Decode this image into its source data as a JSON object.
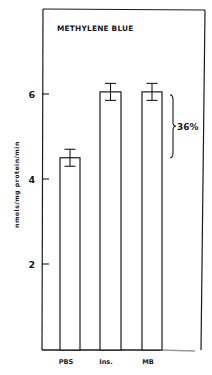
{
  "chart_data": {
    "type": "bar",
    "title": "METHYLENE BLUE",
    "xlabel": "",
    "ylabel": "nmols/mg protein/min",
    "categories": [
      "PBS",
      "Ins.",
      "MB"
    ],
    "values": [
      4.5,
      6.05,
      6.05
    ],
    "error": [
      0.2,
      0.2,
      0.2
    ],
    "ylim": [
      0,
      7.8
    ],
    "yticks": [
      2,
      4,
      6
    ],
    "ytick_labels": [
      "2",
      "4",
      "6"
    ],
    "grid": false,
    "legend": null,
    "annotations": [
      {
        "type": "brace",
        "from_value": 4.5,
        "to_value": 6.05,
        "label": "36%"
      }
    ]
  },
  "colors": {
    "ink": "#1a1a1a",
    "bar_fill": "#ffffff",
    "background": "#ffffff"
  }
}
